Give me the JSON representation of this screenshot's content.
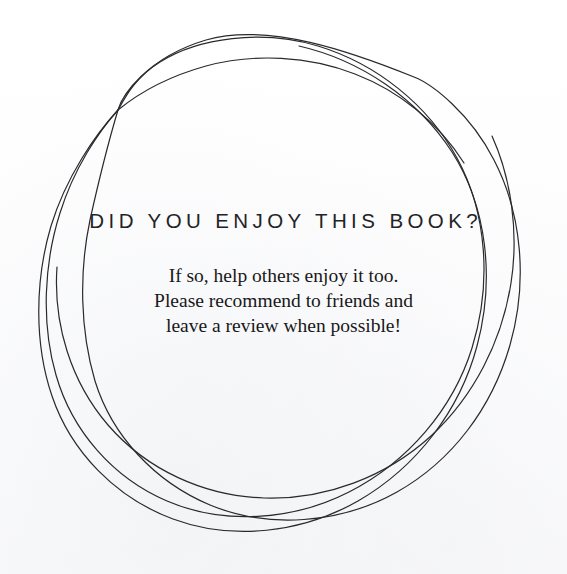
{
  "page": {
    "width": 567,
    "height": 574,
    "background_color": "#fefefe",
    "ink_color": "#2a2a2e",
    "heading_color": "#232326",
    "body_color": "#18181a"
  },
  "heading": {
    "text": "DID YOU ENJOY THIS BOOK?"
  },
  "body": {
    "lines": [
      "If so, help others enjoy it too.",
      "Please recommend to friends and",
      "leave a review when possible!"
    ]
  },
  "decoration": {
    "name": "hand-drawn-circle-doodle",
    "description": "Loose hand-drawn circle made of several overlapping freehand passes, open at the top-right where the pen stroke tapers off.",
    "stroke_width": 1.2,
    "loop_count": 3,
    "paths": [
      "M 414 77 C 352 52 268 22 206 40 C 146 58 122 96 118 110 C 112 130 100 175 90 220 C 79 272 80 330 95 381 C 112 436 155 482 210 505 C 268 529 340 524 397 492 C 452 461 492 408 510 345 C 528 282 522 214 494 160 C 470 113 432 84 414 77 Z",
      "M 118 110 C 99 131 74 168 60 213 C 44 263 41 323 56 375 C 72 431 113 478 167 501 C 223 525 292 521 349 492 C 408 462 453 409 472 348 C 492 284 487 213 457 158 C 428 105 377 64 318 46 C 262 29 198 38 160 62 C 133 79 124 100 118 110 Z",
      "M 118 110 C 95 135 66 177 51 226 C 35 280 34 343 52 396 C 71 452 116 498 173 519 C 232 541 302 533 358 501 C 417 467 460 410 477 346 C 495 279 487 207 452 152 C 417 98 360 60 299 46",
      "M 492 136 C 511 178 519 232 511 283 C 502 341 474 396 431 436 C 386 477 325 500 264 498 C 204 496 147 470 108 425 C 71 382 53 324 57 267",
      "M 118 110 C 140 92 170 76 206 66 C 254 53 309 56 355 74 C 399 91 438 122 464 163"
    ]
  }
}
